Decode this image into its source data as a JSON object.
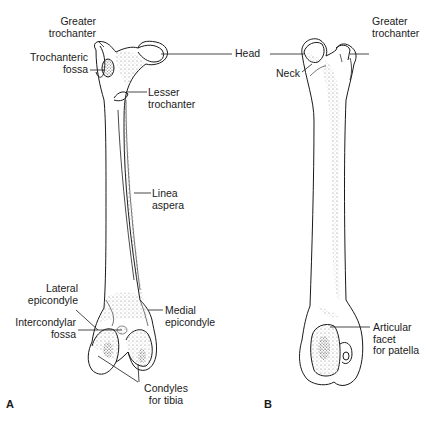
{
  "figure": {
    "panels": [
      {
        "letter": "A",
        "view": "posterior femur"
      },
      {
        "letter": "B",
        "view": "anterior femur"
      }
    ],
    "labels_a": {
      "greater_trochanter": [
        "Greater",
        "trochanter"
      ],
      "trochanteric_fossa": [
        "Trochanteric",
        "fossa"
      ],
      "head": "Head",
      "lesser_trochanter": [
        "Lesser",
        "trochanter"
      ],
      "linea_aspera": [
        "Linea",
        "aspera"
      ],
      "lateral_epicondyle": [
        "Lateral",
        "epicondyle"
      ],
      "intercondylar_fossa": [
        "Intercondylar",
        "fossa"
      ],
      "medial_epicondyle": [
        "Medial",
        "epicondyle"
      ],
      "condyles_for_tibia": [
        "Condyles",
        "for tibia"
      ]
    },
    "labels_b": {
      "neck": "Neck",
      "greater_trochanter": [
        "Greater",
        "trochanter"
      ],
      "articular_facet": [
        "Articular",
        "facet",
        "for patella"
      ]
    },
    "colors": {
      "background": "#ffffff",
      "line": "#1a1a1a",
      "stipple": "#8a8a8a"
    }
  }
}
